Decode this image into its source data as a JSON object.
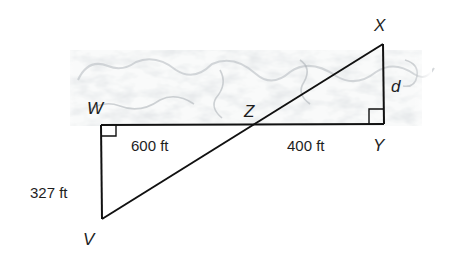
{
  "diagram": {
    "type": "geometry-similar-triangles",
    "background": "river / terrain texture (grey marbled band)",
    "points": {
      "W": {
        "label": "W",
        "x": 101,
        "y": 125
      },
      "Y": {
        "label": "Y",
        "x": 384,
        "y": 124
      },
      "X": {
        "label": "X",
        "x": 383,
        "y": 44
      },
      "V": {
        "label": "V",
        "x": 102,
        "y": 219
      },
      "Z": {
        "label": "Z",
        "x": 258,
        "y": 124
      }
    },
    "segments": [
      {
        "from": "W",
        "to": "Y"
      },
      {
        "from": "X",
        "to": "Y"
      },
      {
        "from": "W",
        "to": "V"
      },
      {
        "from": "V",
        "to": "X"
      }
    ],
    "right_angles": [
      "W",
      "Y"
    ],
    "measurements": {
      "WZ": "600 ft",
      "ZY": "400 ft",
      "WV": "327 ft",
      "XY": "d"
    },
    "colors": {
      "line": "#111111",
      "text": "#1e1e1e",
      "texture": "#c8ccd0"
    }
  }
}
